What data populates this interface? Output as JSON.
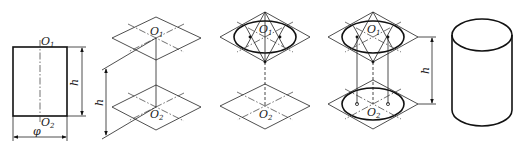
{
  "figure": {
    "panels": [
      {
        "id": "front-view",
        "labels": {
          "top_center": "O",
          "top_center_sub": "1",
          "bottom_center": "O",
          "bottom_center_sub": "2",
          "height": "h",
          "diameter": "φ"
        }
      },
      {
        "id": "step-axes",
        "labels": {
          "top_center": "O",
          "top_center_sub": "1",
          "bottom_center": "O",
          "bottom_center_sub": "2",
          "height": "h"
        }
      },
      {
        "id": "step-top-ellipse",
        "labels": {
          "top_center": "O",
          "top_center_sub": "1",
          "bottom_center": "O",
          "bottom_center_sub": "2"
        }
      },
      {
        "id": "step-bottom-ellipse",
        "labels": {
          "top_center": "O",
          "top_center_sub": "1",
          "bottom_center": "O",
          "bottom_center_sub": "2",
          "height": "h"
        }
      },
      {
        "id": "finished-cylinder",
        "labels": {}
      }
    ]
  },
  "colors": {
    "line": "#111111",
    "background": "#ffffff"
  }
}
